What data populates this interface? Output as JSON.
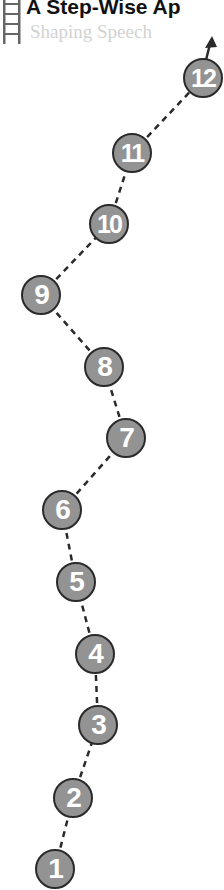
{
  "header": {
    "title": "A Step-Wise Ap",
    "subtitle": "Shaping Speech",
    "icon": "ladder-icon"
  },
  "colors": {
    "circle_fill": "#939393",
    "circle_border": "#2a2a2a",
    "number_text": "#ffffff",
    "path_dash": "#2a2a2a",
    "subtitle_text": "#d2d2d2",
    "title_text": "#111111"
  },
  "steps": [
    {
      "label": "1",
      "x": 55,
      "y": 869
    },
    {
      "label": "2",
      "x": 73,
      "y": 798
    },
    {
      "label": "3",
      "x": 98,
      "y": 725
    },
    {
      "label": "4",
      "x": 95,
      "y": 654
    },
    {
      "label": "5",
      "x": 76,
      "y": 582
    },
    {
      "label": "6",
      "x": 62,
      "y": 510
    },
    {
      "label": "7",
      "x": 126,
      "y": 438
    },
    {
      "label": "8",
      "x": 104,
      "y": 367
    },
    {
      "label": "9",
      "x": 41,
      "y": 295
    },
    {
      "label": "10",
      "x": 109,
      "y": 224
    },
    {
      "label": "11",
      "x": 132,
      "y": 153
    },
    {
      "label": "12",
      "x": 203,
      "y": 78
    }
  ],
  "arrow": {
    "tip_x": 212,
    "tip_y": 36,
    "icon": "arrow-up-icon"
  }
}
